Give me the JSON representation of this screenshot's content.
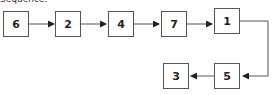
{
  "diagram": {
    "caption": "Sequence:",
    "nodes": [
      {
        "id": "n6",
        "label": "6"
      },
      {
        "id": "n2",
        "label": "2"
      },
      {
        "id": "n4",
        "label": "4"
      },
      {
        "id": "n7",
        "label": "7"
      },
      {
        "id": "n1",
        "label": "1"
      },
      {
        "id": "n5",
        "label": "5"
      },
      {
        "id": "n3",
        "label": "3"
      }
    ],
    "edges": [
      {
        "from": "6",
        "to": "2"
      },
      {
        "from": "2",
        "to": "4"
      },
      {
        "from": "4",
        "to": "7"
      },
      {
        "from": "7",
        "to": "1"
      },
      {
        "from": "1",
        "to": "5"
      },
      {
        "from": "5",
        "to": "3"
      }
    ],
    "colors": {
      "stroke": "#555555",
      "text": "#222222",
      "background": "#ffffff"
    }
  }
}
